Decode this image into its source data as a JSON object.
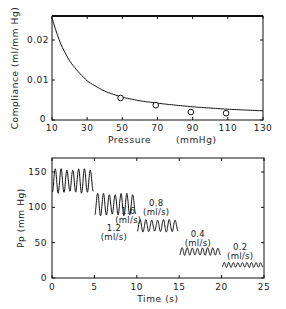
{
  "chart_data": [
    {
      "type": "scatter",
      "title": "",
      "xlabel": "Pressure    (mmHg)",
      "ylabel": "Compliance  (ml/mm Hg)",
      "xlim": [
        10,
        130
      ],
      "ylim": [
        0,
        0.026
      ],
      "x_ticks": [
        "10",
        "30",
        "50",
        "70",
        "90",
        "110",
        "130"
      ],
      "y_ticks": [
        "0",
        "0.01",
        "0.02"
      ],
      "grid": false,
      "series": [
        {
          "name": "measured",
          "marker": "open-circle",
          "x": [
            49,
            69,
            89,
            109
          ],
          "y": [
            0.0055,
            0.0037,
            0.002,
            0.0017
          ]
        },
        {
          "name": "fit",
          "style": "line",
          "x": [
            10,
            15,
            20,
            30,
            40,
            50,
            60,
            70,
            90,
            110,
            130
          ],
          "y": [
            0.0255,
            0.019,
            0.0148,
            0.0098,
            0.0072,
            0.0057,
            0.0048,
            0.0042,
            0.0033,
            0.0027,
            0.0023
          ]
        }
      ]
    },
    {
      "type": "line",
      "title": "",
      "xlabel": "Time  (s)",
      "ylabel": "Pp  (mm Hg)",
      "xlim": [
        0,
        25
      ],
      "ylim": [
        0,
        170
      ],
      "x_ticks": [
        "0",
        "5",
        "10",
        "15",
        "20",
        "25"
      ],
      "y_ticks": [
        "0",
        "50",
        "100",
        "150"
      ],
      "grid": false,
      "segments": [
        {
          "flow": "1.6",
          "unit": "(ml/s)",
          "t_start": 0,
          "t_end": 5,
          "min": 120,
          "max": 155,
          "cycles": 7
        },
        {
          "flow": "1.2",
          "unit": "(ml/s)",
          "t_start": 5,
          "t_end": 10,
          "min": 88,
          "max": 120,
          "cycles": 7
        },
        {
          "flow": "0.8",
          "unit": "(ml/s)",
          "t_start": 10,
          "t_end": 15,
          "min": 65,
          "max": 83,
          "cycles": 7
        },
        {
          "flow": "0.4",
          "unit": "(ml/s)",
          "t_start": 15,
          "t_end": 20,
          "min": 32,
          "max": 43,
          "cycles": 8
        },
        {
          "flow": "0.2",
          "unit": "(ml/s)",
          "t_start": 20,
          "t_end": 25,
          "min": 15,
          "max": 22,
          "cycles": 9
        }
      ]
    }
  ],
  "top": {
    "xlabel_left": "Pressure",
    "xlabel_right": "(mmHg)",
    "ylabel": "Compliance  (ml/mm Hg)"
  },
  "bottom": {
    "xlabel": "Time  (s)",
    "ylabel": "Pp  (mm Hg)"
  }
}
